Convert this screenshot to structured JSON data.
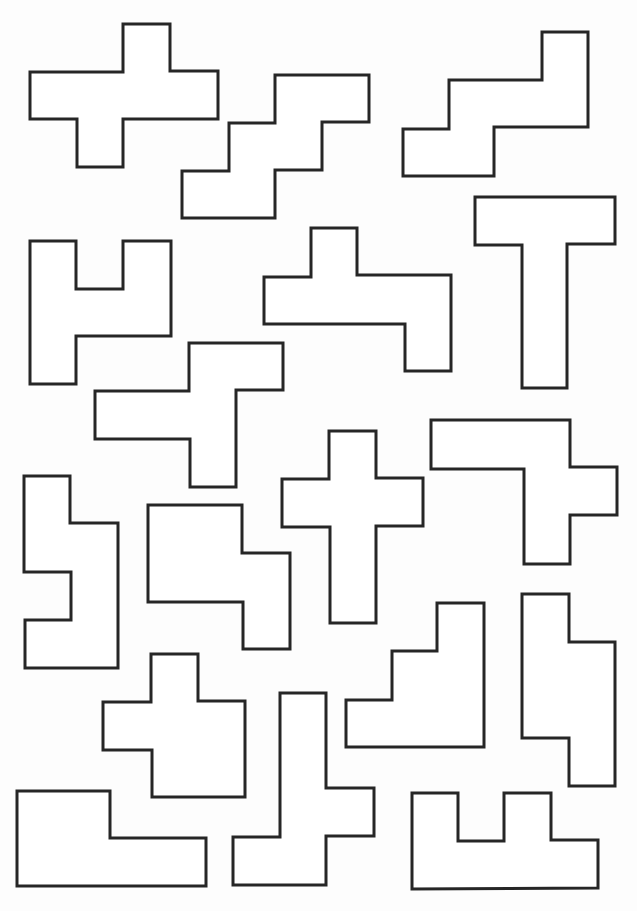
{
  "page": {
    "width": 637,
    "height": 911,
    "background": "#ffffff",
    "stroke_color": "#262626",
    "stroke_width": 3
  },
  "pieces": [
    {
      "name": "piece-x-cross-wide",
      "points": "123,24 170,24 170,71 218,71 218,119 123,119 123,167 77,167 77,119 30,119 30,72 123,72"
    },
    {
      "name": "piece-w-staircase-top",
      "points": "275,75 369,75 369,122 322,122 322,170 275,170 275,218 182,218 182,171 229,171 229,123 275,123"
    },
    {
      "name": "piece-n-step-right",
      "points": "542,32 588,32 588,127 494,127 494,176 403,176 403,129 449,129 449,80 542,80"
    },
    {
      "name": "piece-u-like-left",
      "points": "30,241 76,241 76,289 123,289 123,241 171,241 171,336 76,336 76,384 30,384"
    },
    {
      "name": "piece-f-center",
      "points": "311,228 357,228 357,275 451,275 451,371 405,371 405,324 264,324 264,277 311,277"
    },
    {
      "name": "piece-t-tall",
      "points": "475,197 615,197 615,244 567,244 567,388 522,388 522,245 475,245"
    },
    {
      "name": "piece-y-left",
      "points": "189,343 283,343 283,390 236,390 236,487 190,487 190,439 95,439 95,391 189,391"
    },
    {
      "name": "piece-cross-plus",
      "points": "329,431 376,431 376,478 423,478 423,526 376,526 376,623 330,623 330,527 282,527 282,479 329,479"
    },
    {
      "name": "piece-l-hook-right",
      "points": "431,420 570,420 570,467 617,467 617,515 570,515 570,564 524,564 524,469 431,469"
    },
    {
      "name": "piece-s-zigzag-left",
      "points": "24,476 70,476 70,523 118,523 118,668 25,668 25,620 71,620 71,572 24,572"
    },
    {
      "name": "piece-p-block",
      "points": "148,505 242,505 242,553 290,553 290,649 243,649 243,602 148,602"
    },
    {
      "name": "piece-v-stair-right",
      "points": "437,603 484,603 484,747 346,747 346,700 392,700 392,651 437,651"
    },
    {
      "name": "piece-n-tall-right",
      "points": "522,594 569,594 569,642 615,642 615,786 569,786 569,738 522,738"
    },
    {
      "name": "piece-p-cross-bottom",
      "points": "151,654 198,654 198,701 245,701 245,797 152,797 152,750 103,750 103,702 151,702"
    },
    {
      "name": "piece-l-long-bottom-left",
      "points": "17,791 110,791 110,838 206,838 206,886 17,886"
    },
    {
      "name": "piece-y-bottom-center",
      "points": "280,693 326,693 326,788 374,788 374,836 326,836 326,885 233,885 233,837 280,837"
    },
    {
      "name": "piece-u-bottom-right",
      "points": "412,793 458,793 458,841 504,841 504,793 551,793 551,840 598,840 598,888 412,889"
    }
  ]
}
